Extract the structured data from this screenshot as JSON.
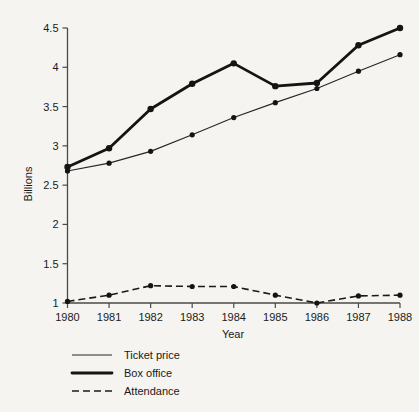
{
  "chart_data": {
    "type": "line",
    "title": "",
    "xlabel": "Year",
    "ylabel": "Billions",
    "categories": [
      "1980",
      "1981",
      "1982",
      "1983",
      "1984",
      "1985",
      "1986",
      "1987",
      "1988"
    ],
    "x": [
      1980,
      1981,
      1982,
      1983,
      1984,
      1985,
      1986,
      1987,
      1988
    ],
    "xlim": [
      1980,
      1988
    ],
    "ylim": [
      1,
      4.5
    ],
    "yticks": [
      1,
      1.5,
      2,
      2.5,
      3,
      3.5,
      4,
      4.5
    ],
    "ytick_labels": [
      "1",
      "1.5",
      "2",
      "2.5",
      "3",
      "3.5",
      "4",
      "4.5"
    ],
    "grid": false,
    "legend_position": "below-left",
    "series": [
      {
        "name": "Ticket price",
        "style": "thin-solid",
        "color": "#262626",
        "values": [
          2.68,
          2.78,
          2.93,
          3.14,
          3.36,
          3.55,
          3.73,
          3.95,
          4.16
        ]
      },
      {
        "name": "Box office",
        "style": "thick-solid",
        "color": "#141414",
        "values": [
          2.73,
          2.97,
          3.47,
          3.79,
          4.05,
          3.76,
          3.8,
          4.28,
          4.5
        ]
      },
      {
        "name": "Attendance",
        "style": "dashed",
        "color": "#1a1a1a",
        "values": [
          1.02,
          1.1,
          1.22,
          1.21,
          1.21,
          1.1,
          1.0,
          1.09,
          1.1
        ]
      }
    ]
  },
  "axes": {
    "y_title": "Billions",
    "x_title": "Year"
  },
  "legend": {
    "items": [
      {
        "label": "Ticket price",
        "swatch": "thin-line-swatch"
      },
      {
        "label": "Box office",
        "swatch": "thick-line-swatch"
      },
      {
        "label": "Attendance",
        "swatch": "dashed-line-swatch"
      }
    ]
  }
}
